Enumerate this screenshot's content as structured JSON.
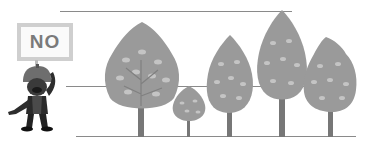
{
  "sign": {
    "label": "NO"
  },
  "guide_lines": [
    {
      "name": "top-line",
      "x": 60,
      "y": 11,
      "width": 232
    },
    {
      "name": "middle-line",
      "x": 66,
      "y": 86,
      "width": 290
    },
    {
      "name": "bottom-line",
      "x": 76,
      "y": 136,
      "width": 280
    }
  ],
  "trees": [
    {
      "name": "tree-1",
      "x": 102,
      "top": 22,
      "width": 78,
      "height": 114
    },
    {
      "name": "tree-2",
      "x": 171,
      "top": 86,
      "width": 34,
      "height": 50
    },
    {
      "name": "tree-3",
      "x": 206,
      "top": 36,
      "width": 48,
      "height": 100
    },
    {
      "name": "tree-4",
      "x": 256,
      "top": 11,
      "width": 52,
      "height": 125
    },
    {
      "name": "tree-5",
      "x": 302,
      "top": 37,
      "width": 54,
      "height": 99
    }
  ],
  "colors": {
    "tree": "#9a9a9a",
    "leaf": "#c4c4c4",
    "trunk": "#777777",
    "line": "#8a8a8a"
  }
}
